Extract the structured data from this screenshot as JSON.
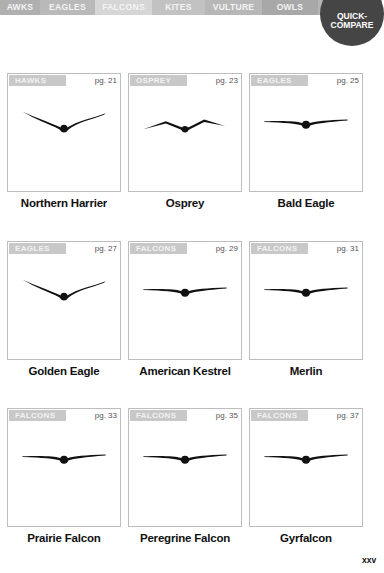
{
  "tabs": [
    {
      "label": "AWKS",
      "width": 40,
      "color": "#b0b0b0"
    },
    {
      "label": "EAGLES",
      "width": 55,
      "color": "#b9b9b9"
    },
    {
      "label": "FALCONS",
      "width": 57,
      "color": "#d6d6d6"
    },
    {
      "label": "KITES",
      "width": 53,
      "color": "#c2c2c2"
    },
    {
      "label": "VULTURE",
      "width": 57,
      "color": "#b7b7b7"
    },
    {
      "label": "OWLS",
      "width": 56,
      "color": "#a8a8a8"
    }
  ],
  "quick_compare": {
    "line1": "QUICK-",
    "line2": "COMPARE"
  },
  "cards": [
    {
      "category": "HAWKS",
      "page": "pg. 21",
      "name": "Northern Harrier",
      "shape": "dihedral"
    },
    {
      "category": "OSPREY",
      "page": "pg. 23",
      "name": "Osprey",
      "shape": "gull"
    },
    {
      "category": "EAGLES",
      "page": "pg. 25",
      "name": "Bald Eagle",
      "shape": "flat"
    },
    {
      "category": "EAGLES",
      "page": "pg. 27",
      "name": "Golden Eagle",
      "shape": "dihedral"
    },
    {
      "category": "FALCONS",
      "page": "pg. 29",
      "name": "American Kestrel",
      "shape": "flat"
    },
    {
      "category": "FALCONS",
      "page": "pg. 31",
      "name": "Merlin",
      "shape": "flat"
    },
    {
      "category": "FALCONS",
      "page": "pg. 33",
      "name": "Prairie Falcon",
      "shape": "flat"
    },
    {
      "category": "FALCONS",
      "page": "pg. 35",
      "name": "Peregrine Falcon",
      "shape": "flat"
    },
    {
      "category": "FALCONS",
      "page": "pg. 37",
      "name": "Gyrfalcon",
      "shape": "flat"
    }
  ],
  "folio": "xxv"
}
